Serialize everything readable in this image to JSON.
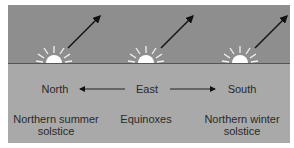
{
  "diagram": {
    "directions": {
      "north": "North",
      "east": "East",
      "south": "South"
    },
    "positions": [
      {
        "line1": "Northern summer",
        "line2": "solstice"
      },
      {
        "line1": "Equinoxes",
        "line2": ""
      },
      {
        "line1": "Northern winter",
        "line2": "solstice"
      }
    ],
    "icons": [
      "sun-rising-icon",
      "sunrise-direction-arrow-icon",
      "west-arrow-icon",
      "east-arrow-icon"
    ],
    "colors": {
      "sky": "#8e8e8e",
      "ground": "#a9a9a9",
      "horizon": "#555555",
      "sun": "#ffffff",
      "arrow": "#111111",
      "text": "#2a2a2a"
    }
  }
}
